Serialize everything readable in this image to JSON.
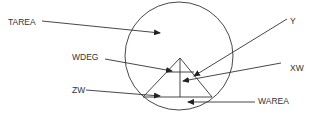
{
  "diagram": {
    "colors": {
      "stroke": "#333333",
      "background": "#ffffff"
    },
    "circle": {
      "cx": 179,
      "cy": 56,
      "r": 54
    },
    "triangle": {
      "apex": [
        180,
        58
      ],
      "base_left": [
        143,
        97
      ],
      "base_right": [
        212,
        97
      ]
    },
    "labels": {
      "tarea": "TAREA",
      "wdeg": "WDEG",
      "zw": "ZW",
      "y": "Y",
      "xw": "XW",
      "warea": "WAREA"
    }
  }
}
